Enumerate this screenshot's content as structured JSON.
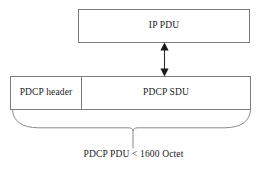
{
  "diagram": {
    "type": "protocol-data-unit-layout",
    "background_color": "#ffffff",
    "line_color": "#7d7d7d",
    "text_color": "#1a1a1a",
    "upper_layer": {
      "box_label": "IP PDU"
    },
    "connector": {
      "icon_name": "double-headed-vertical-arrow",
      "arrowheads": "both",
      "orientation": "vertical"
    },
    "lower_layer": {
      "cells": [
        {
          "label": "PDCP header"
        },
        {
          "label": "PDCP SDU"
        }
      ]
    },
    "brace": {
      "icon_name": "curly-brace-down",
      "caption": "PDCP PDU < 1600 Octet"
    }
  }
}
